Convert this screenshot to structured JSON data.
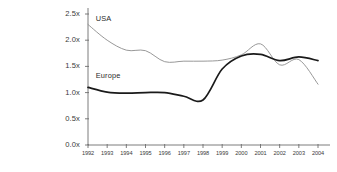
{
  "chart_data": {
    "type": "line",
    "title": "",
    "xlabel": "",
    "ylabel": "",
    "grid": false,
    "legend_position": "inline-label",
    "xlim": [
      1992,
      2004
    ],
    "ylim": [
      0.0,
      2.5
    ],
    "x_tick_labels": [
      "1992",
      "1993",
      "1994",
      "1995",
      "1996",
      "1997",
      "1998",
      "1999",
      "2000",
      "2001",
      "2002",
      "2003",
      "2004"
    ],
    "y_tick_labels": [
      "0.0x",
      "0.5x",
      "1.0x",
      "1.5x",
      "2.0x",
      "2.5x"
    ],
    "y_tick_values": [
      0.0,
      0.5,
      1.0,
      1.5,
      2.0,
      2.5
    ],
    "x": [
      1992,
      1993,
      1994,
      1995,
      1996,
      1997,
      1998,
      1999,
      2000,
      2001,
      2002,
      2003,
      2004
    ],
    "series": [
      {
        "name": "USA",
        "color": "#8c8c8c",
        "line_width": 0.9,
        "label_x": 1992.3,
        "label_y": 2.33,
        "values": [
          2.3,
          2.0,
          1.81,
          1.8,
          1.59,
          1.6,
          1.6,
          1.62,
          1.72,
          1.93,
          1.53,
          1.63,
          1.16
        ]
      },
      {
        "name": "Europe",
        "color": "#1a1a1a",
        "line_width": 1.7,
        "label_x": 1992.3,
        "label_y": 1.24,
        "values": [
          1.1,
          1.01,
          0.99,
          1.0,
          1.0,
          0.93,
          0.86,
          1.45,
          1.7,
          1.73,
          1.61,
          1.68,
          1.61
        ]
      }
    ],
    "axis_color": "#6e6e6e",
    "background": "#ffffff",
    "text_color": "#3a3a3a"
  },
  "axes_geometry": {
    "plot_left": 88,
    "plot_right": 318,
    "plot_top": 14,
    "plot_bottom": 145
  }
}
